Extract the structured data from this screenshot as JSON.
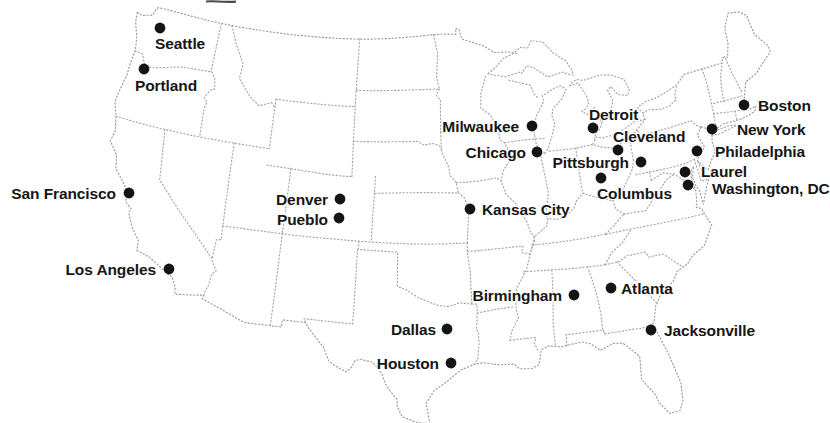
{
  "map": {
    "background_color": "#ffffff",
    "border_line_color": "#a6a6a6",
    "coast_line_color": "#9b9b9b",
    "city_dot_color": "#141414",
    "city_label_color": "#161616",
    "artifact_color": "#4a4a4a"
  },
  "cities": [
    {
      "name": "Seattle",
      "dot": {
        "x": 160,
        "y": 28
      },
      "label": {
        "x": 155,
        "y": 43,
        "anchor": "start"
      }
    },
    {
      "name": "Portland",
      "dot": {
        "x": 144,
        "y": 69
      },
      "label": {
        "x": 135,
        "y": 85,
        "anchor": "start"
      }
    },
    {
      "name": "San Francisco",
      "dot": {
        "x": 129,
        "y": 193
      },
      "label": {
        "x": 116,
        "y": 193,
        "anchor": "end"
      }
    },
    {
      "name": "Los Angeles",
      "dot": {
        "x": 169,
        "y": 269
      },
      "label": {
        "x": 156,
        "y": 269,
        "anchor": "end"
      }
    },
    {
      "name": "Denver",
      "dot": {
        "x": 340,
        "y": 199
      },
      "label": {
        "x": 328,
        "y": 199,
        "anchor": "end"
      }
    },
    {
      "name": "Pueblo",
      "dot": {
        "x": 339,
        "y": 218
      },
      "label": {
        "x": 328,
        "y": 219,
        "anchor": "end"
      }
    },
    {
      "name": "Kansas City",
      "dot": {
        "x": 470,
        "y": 209
      },
      "label": {
        "x": 482,
        "y": 209,
        "anchor": "start"
      }
    },
    {
      "name": "Milwaukee",
      "dot": {
        "x": 532,
        "y": 126
      },
      "label": {
        "x": 519,
        "y": 126,
        "anchor": "end"
      }
    },
    {
      "name": "Chicago",
      "dot": {
        "x": 537,
        "y": 152
      },
      "label": {
        "x": 526,
        "y": 152,
        "anchor": "end"
      }
    },
    {
      "name": "Detroit",
      "dot": {
        "x": 593,
        "y": 128
      },
      "label": {
        "x": 589,
        "y": 114,
        "anchor": "start"
      }
    },
    {
      "name": "Cleveland",
      "dot": {
        "x": 618,
        "y": 150
      },
      "label": {
        "x": 613,
        "y": 136,
        "anchor": "start"
      }
    },
    {
      "name": "Pittsburgh",
      "dot": {
        "x": 641,
        "y": 162
      },
      "label": {
        "x": 629,
        "y": 162,
        "anchor": "end"
      }
    },
    {
      "name": "Columbus",
      "dot": {
        "x": 601,
        "y": 178
      },
      "label": {
        "x": 597,
        "y": 193,
        "anchor": "start"
      }
    },
    {
      "name": "Boston",
      "dot": {
        "x": 744,
        "y": 105
      },
      "label": {
        "x": 758,
        "y": 105,
        "anchor": "start"
      }
    },
    {
      "name": "New York",
      "dot": {
        "x": 712,
        "y": 129
      },
      "label": {
        "x": 737,
        "y": 129,
        "anchor": "start"
      }
    },
    {
      "name": "Philadelphia",
      "dot": {
        "x": 697,
        "y": 151
      },
      "label": {
        "x": 715,
        "y": 151,
        "anchor": "start"
      }
    },
    {
      "name": "Laurel",
      "dot": {
        "x": 685,
        "y": 172
      },
      "label": {
        "x": 701,
        "y": 171,
        "anchor": "start"
      }
    },
    {
      "name": "Washington, DC",
      "dot": {
        "x": 688,
        "y": 185
      },
      "label": {
        "x": 712,
        "y": 188,
        "anchor": "start"
      }
    },
    {
      "name": "Atlanta",
      "dot": {
        "x": 611,
        "y": 288
      },
      "label": {
        "x": 621,
        "y": 288,
        "anchor": "start"
      }
    },
    {
      "name": "Birmingham",
      "dot": {
        "x": 574,
        "y": 295
      },
      "label": {
        "x": 562,
        "y": 295,
        "anchor": "end"
      }
    },
    {
      "name": "Jacksonville",
      "dot": {
        "x": 651,
        "y": 330
      },
      "label": {
        "x": 664,
        "y": 330,
        "anchor": "start"
      }
    },
    {
      "name": "Dallas",
      "dot": {
        "x": 447,
        "y": 329
      },
      "label": {
        "x": 436,
        "y": 329,
        "anchor": "end"
      }
    },
    {
      "name": "Houston",
      "dot": {
        "x": 451,
        "y": 363
      },
      "label": {
        "x": 439,
        "y": 363,
        "anchor": "end"
      }
    }
  ]
}
